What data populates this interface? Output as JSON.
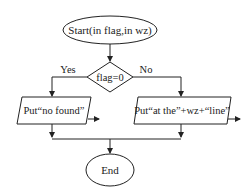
{
  "flowchart": {
    "start": {
      "label": "Start(in flag,in wz)"
    },
    "decision": {
      "label": "flag=0",
      "yes_label": "Yes",
      "no_label": "No"
    },
    "yes_output": {
      "label": "Put“no found”"
    },
    "no_output": {
      "label": "Put“at the”+wz+“line”"
    },
    "end": {
      "label": "End"
    }
  },
  "colors": {
    "stroke": "#222222",
    "background": "#ffffff"
  }
}
